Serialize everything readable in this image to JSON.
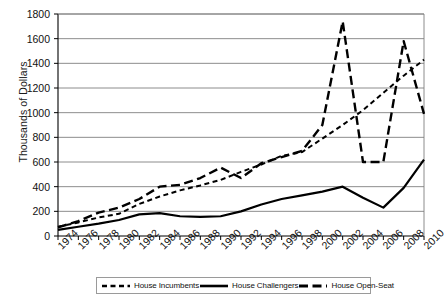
{
  "chart_data": {
    "type": "line",
    "title": "",
    "xlabel": "",
    "ylabel": "Thousands of Dollars",
    "ylim": [
      0,
      1800
    ],
    "ytick_step": 200,
    "grid": true,
    "legend_position": "bottom",
    "categories": [
      1974,
      1976,
      1978,
      1980,
      1982,
      1984,
      1986,
      1988,
      1990,
      1992,
      1994,
      1996,
      1998,
      2000,
      2002,
      2004,
      2006,
      2008,
      2010
    ],
    "ytick_labels": [
      "1800",
      "1600",
      "1400",
      "1200",
      "1000",
      "800",
      "600",
      "400",
      "200",
      "0"
    ],
    "xtick_labels": [
      "1974",
      "1976",
      "1978",
      "1980",
      "1982",
      "1984",
      "1986",
      "1988",
      "1990",
      "1992",
      "1994",
      "1996",
      "1998",
      "2000",
      "2002",
      "2004",
      "2006",
      "2008",
      "2010"
    ],
    "series": [
      {
        "name": "House Incumbents",
        "dash": "short-dash",
        "color": "#000000",
        "values": [
          75,
          110,
          150,
          180,
          260,
          320,
          370,
          410,
          455,
          520,
          580,
          650,
          680,
          790,
          900,
          1020,
          1160,
          1300,
          1430
        ]
      },
      {
        "name": "House Challengers",
        "dash": "solid",
        "color": "#000000",
        "values": [
          50,
          75,
          100,
          130,
          175,
          185,
          160,
          155,
          160,
          200,
          255,
          300,
          330,
          360,
          400,
          310,
          230,
          390,
          620
        ]
      },
      {
        "name": "House Open-Seat",
        "dash": "long-dash",
        "color": "#000000",
        "values": [
          70,
          120,
          190,
          230,
          300,
          400,
          415,
          470,
          555,
          470,
          590,
          640,
          690,
          900,
          1740,
          600,
          600,
          1580,
          990
        ]
      }
    ]
  },
  "legend": {
    "items": [
      {
        "label": "House Incumbents",
        "dash": "short-dash"
      },
      {
        "label": "House Challengers",
        "dash": "solid"
      },
      {
        "label": "House Open-Seat",
        "dash": "long-dash"
      }
    ]
  }
}
